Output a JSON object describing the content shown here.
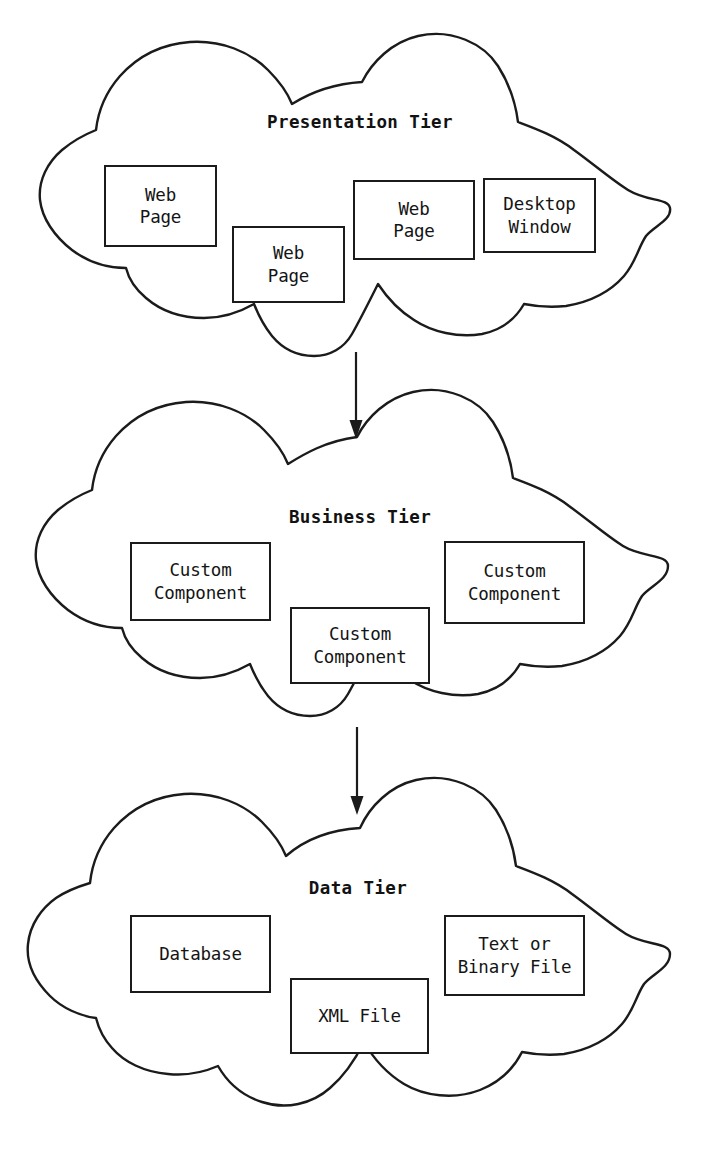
{
  "diagram": {
    "background_color": "#ffffff",
    "stroke_color": "#1b1b1b",
    "text_color": "#141414",
    "tiers": [
      {
        "id": "presentation",
        "title": "Presentation Tier",
        "title_x": 360,
        "title_y": 112,
        "nodes": [
          {
            "id": "web-page-1",
            "label": "Web\nPage",
            "x": 104,
            "y": 165,
            "w": 113,
            "h": 82
          },
          {
            "id": "web-page-2",
            "label": "Web\nPage",
            "x": 232,
            "y": 226,
            "w": 113,
            "h": 77
          },
          {
            "id": "web-page-3",
            "label": "Web\nPage",
            "x": 353,
            "y": 180,
            "w": 122,
            "h": 80
          },
          {
            "id": "desktop-window",
            "label": "Desktop\nWindow",
            "x": 483,
            "y": 178,
            "w": 113,
            "h": 75
          }
        ]
      },
      {
        "id": "business",
        "title": "Business Tier",
        "title_x": 360,
        "title_y": 507,
        "nodes": [
          {
            "id": "custom-component-1",
            "label": "Custom\nComponent",
            "x": 130,
            "y": 542,
            "w": 141,
            "h": 79
          },
          {
            "id": "custom-component-2",
            "label": "Custom\nComponent",
            "x": 290,
            "y": 607,
            "w": 140,
            "h": 77
          },
          {
            "id": "custom-component-3",
            "label": "Custom\nComponent",
            "x": 444,
            "y": 541,
            "w": 141,
            "h": 83
          }
        ]
      },
      {
        "id": "data",
        "title": "Data Tier",
        "title_x": 358,
        "title_y": 878,
        "nodes": [
          {
            "id": "database",
            "label": "Database",
            "x": 130,
            "y": 915,
            "w": 141,
            "h": 78
          },
          {
            "id": "xml-file",
            "label": "XML File",
            "x": 290,
            "y": 978,
            "w": 139,
            "h": 76
          },
          {
            "id": "text-binary-file",
            "label": "Text or\nBinary File",
            "x": 444,
            "y": 915,
            "w": 141,
            "h": 81
          }
        ]
      }
    ],
    "connectors": [
      {
        "id": "presentation-to-business",
        "from": "presentation",
        "to": "business",
        "x": 356,
        "y1": 352,
        "y2": 437,
        "direction": "down"
      },
      {
        "id": "business-to-data",
        "from": "business",
        "to": "data",
        "x": 357,
        "y1": 727,
        "y2": 813,
        "direction": "down"
      }
    ]
  }
}
